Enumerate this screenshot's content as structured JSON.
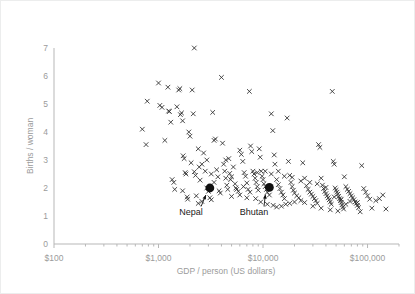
{
  "chart_data": {
    "type": "scatter",
    "title": "",
    "xlabel": "GDP / person (US dollars)",
    "ylabel": "Births / woman",
    "x_scale": "log",
    "y_scale": "linear",
    "xlim": [
      100,
      200000
    ],
    "ylim": [
      0,
      7
    ],
    "grid": false,
    "legend": null,
    "x_tick_labels": [
      "$100",
      "$1,000",
      "$10,000",
      "$100,000"
    ],
    "x_tick_values": [
      100,
      1000,
      10000,
      100000
    ],
    "y_tick_labels": [
      "0",
      "1",
      "2",
      "3",
      "4",
      "5",
      "6",
      "7"
    ],
    "y_tick_values": [
      0,
      1,
      2,
      3,
      4,
      5,
      6,
      7
    ],
    "marker": "x",
    "annotations": [
      {
        "label": "Nepal",
        "x": 3100,
        "y": 2.0,
        "marker": "filled-circle",
        "label_x": 2050,
        "label_y": 1.02
      },
      {
        "label": "Bhutan",
        "x": 11500,
        "y": 2.02,
        "marker": "filled-circle",
        "label_x": 8200,
        "label_y": 1.02
      }
    ],
    "points": [
      [
        780,
        5.1
      ],
      [
        700,
        4.1
      ],
      [
        760,
        3.55
      ],
      [
        1000,
        5.75
      ],
      [
        1030,
        4.95
      ],
      [
        1080,
        4.88
      ],
      [
        1150,
        3.7
      ],
      [
        1230,
        5.6
      ],
      [
        1250,
        4.75
      ],
      [
        1270,
        4.73
      ],
      [
        1310,
        4.35
      ],
      [
        1400,
        2.2
      ],
      [
        1430,
        1.95
      ],
      [
        1500,
        4.9
      ],
      [
        1560,
        5.5
      ],
      [
        1600,
        5.55
      ],
      [
        1620,
        4.62
      ],
      [
        1660,
        4.68
      ],
      [
        1700,
        4.4
      ],
      [
        1720,
        3.15
      ],
      [
        1760,
        3.05
      ],
      [
        1800,
        2.55
      ],
      [
        1830,
        2.5
      ],
      [
        1880,
        1.68
      ],
      [
        1950,
        4.0
      ],
      [
        2000,
        3.85
      ],
      [
        2050,
        2.9
      ],
      [
        2100,
        5.5
      ],
      [
        2150,
        4.65
      ],
      [
        2200,
        2.58
      ],
      [
        2260,
        2.45
      ],
      [
        2300,
        1.72
      ],
      [
        2400,
        3.4
      ],
      [
        2450,
        2.75
      ],
      [
        2500,
        2.28
      ],
      [
        2600,
        1.52
      ],
      [
        2700,
        3.25
      ],
      [
        2800,
        2.6
      ],
      [
        2900,
        2.0
      ],
      [
        3000,
        1.88
      ],
      [
        3100,
        1.65
      ],
      [
        3200,
        2.5
      ],
      [
        3300,
        4.7
      ],
      [
        3400,
        3.7
      ],
      [
        3500,
        3.75
      ],
      [
        3600,
        2.65
      ],
      [
        3700,
        2.4
      ],
      [
        3800,
        1.9
      ],
      [
        3900,
        1.82
      ],
      [
        4000,
        5.95
      ],
      [
        4100,
        3.6
      ],
      [
        4200,
        2.85
      ],
      [
        4300,
        2.6
      ],
      [
        4400,
        2.35
      ],
      [
        4500,
        2.1
      ],
      [
        4600,
        1.95
      ],
      [
        4700,
        3.05
      ],
      [
        4800,
        2.52
      ],
      [
        4900,
        2.3
      ],
      [
        5000,
        2.4
      ],
      [
        5200,
        2.75
      ],
      [
        5400,
        2.15
      ],
      [
        5600,
        1.95
      ],
      [
        5800,
        1.88
      ],
      [
        6000,
        3.35
      ],
      [
        6200,
        3.2
      ],
      [
        6400,
        2.95
      ],
      [
        6600,
        2.55
      ],
      [
        6800,
        2.42
      ],
      [
        7000,
        2.18
      ],
      [
        7200,
        1.95
      ],
      [
        7400,
        5.45
      ],
      [
        7600,
        3.5
      ],
      [
        7800,
        3.3
      ],
      [
        8000,
        2.6
      ],
      [
        8200,
        2.5
      ],
      [
        8400,
        2.35
      ],
      [
        8600,
        2.2
      ],
      [
        8800,
        2.05
      ],
      [
        9000,
        1.92
      ],
      [
        9200,
        3.4
      ],
      [
        9400,
        3.1
      ],
      [
        9600,
        2.6
      ],
      [
        9800,
        2.42
      ],
      [
        10000,
        2.3
      ],
      [
        10200,
        2.15
      ],
      [
        10500,
        2.05
      ],
      [
        10800,
        1.95
      ],
      [
        11000,
        1.85
      ],
      [
        11500,
        1.75
      ],
      [
        12000,
        4.65
      ],
      [
        12400,
        4.05
      ],
      [
        12800,
        3.18
      ],
      [
        13000,
        2.85
      ],
      [
        13500,
        2.3
      ],
      [
        14000,
        2.12
      ],
      [
        14500,
        1.98
      ],
      [
        15000,
        1.85
      ],
      [
        15500,
        1.75
      ],
      [
        16000,
        1.62
      ],
      [
        16500,
        1.42
      ],
      [
        17000,
        4.5
      ],
      [
        17500,
        2.95
      ],
      [
        18000,
        2.45
      ],
      [
        18500,
        2.2
      ],
      [
        19000,
        2.05
      ],
      [
        19500,
        1.92
      ],
      [
        20000,
        1.82
      ],
      [
        21000,
        1.72
      ],
      [
        22000,
        1.65
      ],
      [
        23000,
        1.55
      ],
      [
        24000,
        2.9
      ],
      [
        25000,
        2.35
      ],
      [
        26000,
        2.08
      ],
      [
        27000,
        1.95
      ],
      [
        28000,
        1.85
      ],
      [
        29000,
        1.78
      ],
      [
        30000,
        1.7
      ],
      [
        31000,
        1.62
      ],
      [
        32000,
        1.55
      ],
      [
        33000,
        1.45
      ],
      [
        34000,
        3.55
      ],
      [
        35000,
        3.45
      ],
      [
        36000,
        2.35
      ],
      [
        37000,
        2.1
      ],
      [
        38000,
        1.98
      ],
      [
        39000,
        1.88
      ],
      [
        40000,
        1.8
      ],
      [
        41000,
        1.72
      ],
      [
        42000,
        1.65
      ],
      [
        43000,
        1.58
      ],
      [
        44000,
        1.5
      ],
      [
        45000,
        1.42
      ],
      [
        46000,
        5.45
      ],
      [
        47000,
        2.95
      ],
      [
        48000,
        2.85
      ],
      [
        49000,
        2.0
      ],
      [
        50000,
        1.92
      ],
      [
        51000,
        1.85
      ],
      [
        52000,
        1.78
      ],
      [
        53000,
        1.7
      ],
      [
        54000,
        1.62
      ],
      [
        55000,
        1.55
      ],
      [
        56000,
        1.48
      ],
      [
        57000,
        1.4
      ],
      [
        58000,
        1.32
      ],
      [
        59000,
        1.25
      ],
      [
        60000,
        2.4
      ],
      [
        62000,
        2.05
      ],
      [
        64000,
        1.95
      ],
      [
        66000,
        1.88
      ],
      [
        68000,
        1.8
      ],
      [
        70000,
        1.72
      ],
      [
        72000,
        1.65
      ],
      [
        74000,
        1.58
      ],
      [
        76000,
        1.5
      ],
      [
        78000,
        1.45
      ],
      [
        80000,
        1.38
      ],
      [
        82000,
        1.3
      ],
      [
        85000,
        1.15
      ],
      [
        88000,
        2.8
      ],
      [
        92000,
        1.98
      ],
      [
        96000,
        1.85
      ],
      [
        100000,
        1.72
      ],
      [
        105000,
        1.6
      ],
      [
        110000,
        1.28
      ],
      [
        120000,
        1.55
      ],
      [
        130000,
        1.62
      ],
      [
        140000,
        1.75
      ],
      [
        150000,
        1.25
      ],
      [
        2200,
        7.0
      ],
      [
        1900,
        1.6
      ],
      [
        2600,
        2.85
      ],
      [
        3400,
        2.2
      ],
      [
        5000,
        1.7
      ],
      [
        6000,
        1.75
      ],
      [
        7000,
        1.65
      ],
      [
        2900,
        3.0
      ],
      [
        4400,
        3.0
      ],
      [
        8500,
        1.62
      ],
      [
        9500,
        1.5
      ],
      [
        11000,
        1.42
      ],
      [
        12500,
        1.38
      ],
      [
        13500,
        1.32
      ],
      [
        15000,
        1.35
      ],
      [
        18000,
        1.45
      ],
      [
        20000,
        1.5
      ],
      [
        25000,
        1.48
      ],
      [
        30000,
        1.35
      ],
      [
        36000,
        1.28
      ],
      [
        44000,
        1.22
      ],
      [
        52000,
        1.18
      ],
      [
        62000,
        1.42
      ],
      [
        3200,
        1.58
      ],
      [
        2400,
        1.45
      ],
      [
        1700,
        1.9
      ],
      [
        1350,
        2.3
      ],
      [
        5500,
        2.0
      ],
      [
        6500,
        2.05
      ],
      [
        7500,
        1.85
      ],
      [
        8800,
        2.55
      ],
      [
        10500,
        2.6
      ],
      [
        12000,
        2.5
      ],
      [
        14000,
        2.6
      ],
      [
        16000,
        2.42
      ],
      [
        19000,
        2.38
      ],
      [
        23000,
        2.25
      ],
      [
        28000,
        2.2
      ],
      [
        33000,
        2.15
      ],
      [
        40000,
        2.02
      ],
      [
        48000,
        1.68
      ],
      [
        56000,
        1.6
      ],
      [
        68000,
        1.52
      ],
      [
        80000,
        1.48
      ]
    ]
  },
  "axes": {
    "x_axis_name": "gdp-axis",
    "y_axis_name": "births-axis"
  }
}
